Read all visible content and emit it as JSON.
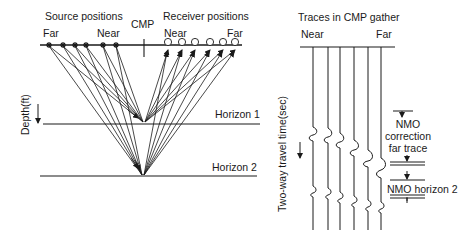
{
  "left_panel": {
    "source_label": "Source positions",
    "source_far": "Far",
    "source_near": "Near",
    "cmp_label": "CMP",
    "receiver_label": "Receiver positions",
    "receiver_near": "Near",
    "receiver_far": "Far",
    "depth_axis_label": "Depth(ft)",
    "horizon1_label": "Horizon 1",
    "horizon2_label": "Horizon 2",
    "source_x": [
      49,
      63,
      75,
      86,
      103,
      116
    ],
    "receiver_x": [
      168,
      182,
      195,
      210,
      223,
      235
    ],
    "cmp_x": 144,
    "surface_y": 45,
    "horizon1_y": 124,
    "horizon2_y": 176
  },
  "right_panel": {
    "title": "Traces in CMP gather",
    "near_label": "Near",
    "far_label": "Far",
    "time_axis_label": "Two-way travel time(sec)",
    "nmo_correction_label_1": "NMO",
    "nmo_correction_label_2": "correction",
    "nmo_correction_label_3": "far trace",
    "nmo_horizon2_label": "NMO horizon 2",
    "trace_count": 6
  },
  "colors": {
    "ink": "#1a1a1a",
    "background": "#ffffff"
  }
}
